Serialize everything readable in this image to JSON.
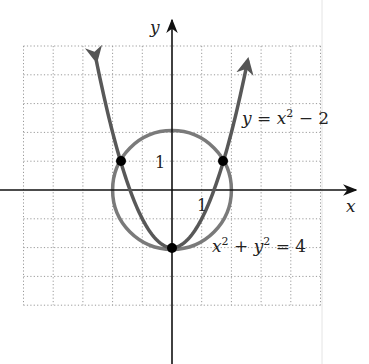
{
  "chart_data": {
    "type": "line",
    "title": "",
    "xlabel": "x",
    "ylabel": "y",
    "xlim": [
      -5,
      5
    ],
    "ylim": [
      -4,
      5
    ],
    "grid": true,
    "grid_style": "dotted",
    "tick_labels": {
      "x": [
        "1"
      ],
      "y": [
        "1"
      ]
    },
    "series": [
      {
        "name": "y = x^2 - 2",
        "kind": "parabola",
        "equation": "y = x^2 - 2",
        "color": "#5a5a5a",
        "x_range": [
          -2.55,
          2.55
        ],
        "arrows": "both-ends"
      },
      {
        "name": "x^2 + y^2 = 4",
        "kind": "circle",
        "equation": "x^2 + y^2 = 4",
        "center": [
          0,
          0
        ],
        "radius": 2,
        "color": "#7a7a7a"
      }
    ],
    "points": [
      {
        "x": -1.732,
        "y": 1,
        "label": "(-√3, 1)"
      },
      {
        "x": 1.732,
        "y": 1,
        "label": "(√3, 1)"
      },
      {
        "x": 0,
        "y": -2,
        "label": "(0, -2)"
      }
    ],
    "annotations": [
      {
        "text": "y = x² − 2",
        "near": [
          2.5,
          2
        ]
      },
      {
        "text": "x² + y² = 4",
        "near": [
          1.5,
          -2.2
        ]
      }
    ]
  },
  "labels": {
    "x_axis": "x",
    "y_axis": "y",
    "tick_x_1": "1",
    "tick_y_1": "1",
    "parabola_eq_y": "y",
    "parabola_eq_eq": " = ",
    "parabola_eq_x": "x",
    "parabola_eq_sup": "2",
    "parabola_eq_rest": " − 2",
    "circle_eq_x": "x",
    "circle_eq_sup1": "2",
    "circle_eq_plus": " + ",
    "circle_eq_y": "y",
    "circle_eq_sup2": "2",
    "circle_eq_rest": " = 4"
  }
}
